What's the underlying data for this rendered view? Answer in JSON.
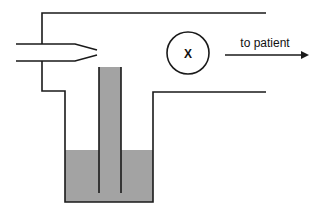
{
  "diagram": {
    "type": "apparatus-schematic",
    "circle_label": "X",
    "arrow_label": "to patient",
    "colors": {
      "line": "#1a1a1a",
      "liquid": "#a3a3a3",
      "background": "#ffffff"
    }
  }
}
